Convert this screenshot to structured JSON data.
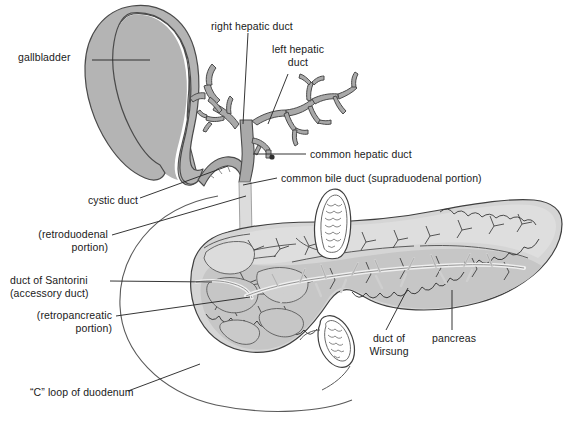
{
  "figure": {
    "type": "anatomical-diagram",
    "background_color": "#ffffff",
    "colors": {
      "gallbladder_fill": "#b4b4b4",
      "duct_fill": "#a9a9a9",
      "bile_duct_pale_fill": "#dcdcdc",
      "pancreas_body_fill": "#c9c9c9",
      "pancreas_light_fill": "#dedede",
      "duodenum_fill": "#ffffff",
      "outline": "#3c3c3c",
      "leader_line": "#2b2b2b",
      "text": "#1a1a1a"
    }
  },
  "labels": [
    {
      "id": "gallbladder",
      "text": "gallbladder",
      "x": 18,
      "y": 51,
      "align": "left"
    },
    {
      "id": "right-hepatic-duct",
      "text": "right hepatic duct",
      "x": 211,
      "y": 20,
      "align": "left"
    },
    {
      "id": "left-hepatic-duct",
      "text": "left hepatic\nduct",
      "x": 272,
      "y": 43,
      "align": "left"
    },
    {
      "id": "common-hepatic-duct",
      "text": "common hepatic duct",
      "x": 310,
      "y": 148,
      "align": "left"
    },
    {
      "id": "common-bile-duct",
      "text": "common bile duct (supraduodenal portion)",
      "x": 281,
      "y": 172,
      "align": "left"
    },
    {
      "id": "cystic-duct",
      "text": "cystic duct",
      "x": 88,
      "y": 194,
      "align": "left"
    },
    {
      "id": "retroduodenal",
      "text": "(retroduodenal\nportion)",
      "x": 22,
      "y": 228,
      "align": "left"
    },
    {
      "id": "duct-of-santorini",
      "text": "duct of Santorini\n(accessory duct)",
      "x": 18,
      "y": 274,
      "align": "left"
    },
    {
      "id": "retropancreatic",
      "text": "(retropancreatic\nportion)",
      "x": 28,
      "y": 309,
      "align": "left"
    },
    {
      "id": "c-loop-duodenum",
      "text": "“C” loop of duodenum",
      "x": 32,
      "y": 386,
      "align": "left"
    },
    {
      "id": "duct-of-wirsung",
      "text": "duct of\nWirsung",
      "x": 367,
      "y": 336,
      "align": "left"
    },
    {
      "id": "pancreas",
      "text": "pancreas",
      "x": 432,
      "y": 336,
      "align": "left"
    }
  ]
}
